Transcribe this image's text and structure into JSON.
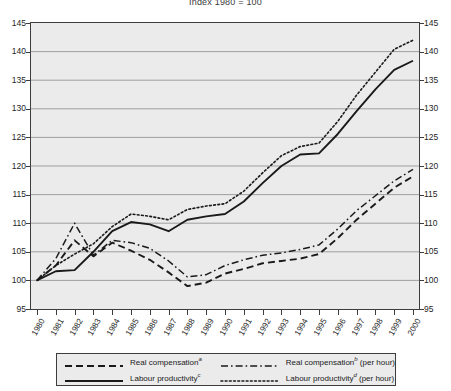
{
  "title": "Index 1980 = 100",
  "chart_data": {
    "type": "line",
    "title": "Index 1980 = 100",
    "xlabel": "",
    "ylabel": "",
    "ylim": [
      95,
      145
    ],
    "yticks": [
      95,
      100,
      105,
      110,
      115,
      120,
      125,
      130,
      135,
      140,
      145
    ],
    "grid": true,
    "legend_position": "bottom",
    "x": [
      1980,
      1981,
      1982,
      1983,
      1984,
      1985,
      1986,
      1987,
      1988,
      1989,
      1990,
      1991,
      1992,
      1993,
      1994,
      1995,
      1996,
      1997,
      1998,
      1999,
      2000
    ],
    "categories": [
      "1980",
      "1981",
      "1982",
      "1983",
      "1984",
      "1985",
      "1986",
      "1987",
      "1988",
      "1989",
      "1990",
      "1991",
      "1992",
      "1993",
      "1994",
      "1995",
      "1996",
      "1997",
      "1998",
      "1999",
      "2000"
    ],
    "series": [
      {
        "name": "Real compensation",
        "footnote": "a",
        "style": "dashed",
        "values": [
          100.0,
          102.6,
          107.0,
          104.2,
          106.6,
          105.2,
          103.6,
          101.4,
          99.0,
          99.6,
          101.2,
          102.0,
          103.0,
          103.4,
          103.8,
          104.6,
          107.4,
          110.6,
          113.4,
          116.2,
          118.2
        ]
      },
      {
        "name": "Real compensation (per hour)",
        "footnote": "b",
        "style": "dash-dot",
        "values": [
          100.0,
          103.8,
          110.0,
          104.4,
          107.0,
          106.6,
          105.6,
          103.4,
          100.6,
          101.0,
          102.6,
          103.6,
          104.4,
          104.8,
          105.4,
          106.2,
          109.0,
          112.2,
          114.8,
          117.4,
          119.4
        ]
      },
      {
        "name": "Labour productivity",
        "footnote": "c",
        "style": "solid",
        "values": [
          100.0,
          101.6,
          101.8,
          105.0,
          108.6,
          110.2,
          109.8,
          108.6,
          110.6,
          111.2,
          111.6,
          113.8,
          117.0,
          120.0,
          122.0,
          122.2,
          125.6,
          129.6,
          133.4,
          136.8,
          138.4
        ]
      },
      {
        "name": "Labour productivity (per hour)",
        "footnote": "d",
        "style": "dotted",
        "values": [
          100.0,
          102.6,
          104.6,
          106.4,
          109.4,
          111.6,
          111.2,
          110.6,
          112.4,
          113.0,
          113.4,
          115.6,
          118.8,
          121.8,
          123.4,
          124.0,
          127.8,
          132.4,
          136.4,
          140.4,
          142.0
        ]
      }
    ]
  },
  "legend": {
    "items": [
      {
        "label": "Real compensation",
        "sup": "a",
        "suffix": "",
        "style": "dashed"
      },
      {
        "label": "Real compensation",
        "sup": "b",
        "suffix": " (per hour)",
        "style": "dash-dot"
      },
      {
        "label": "Labour productivity",
        "sup": "c",
        "suffix": "",
        "style": "solid"
      },
      {
        "label": "Labour productivity",
        "sup": "d",
        "suffix": " (per hour)",
        "style": "dotted"
      }
    ]
  },
  "colors": {
    "line": "#1a1a1a",
    "plot_background": "#ebebeb",
    "grid": "#8c8c8c",
    "frame": "#3d3d3d"
  }
}
